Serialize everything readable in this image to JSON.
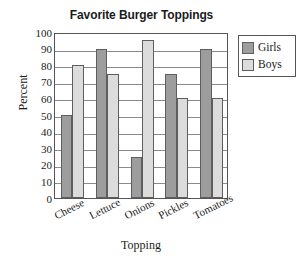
{
  "chart_data": {
    "type": "bar",
    "title": "Favorite Burger Toppings",
    "xlabel": "Topping",
    "ylabel": "Percent",
    "categories": [
      "Cheese",
      "Lettuce",
      "Onions",
      "Pickles",
      "Tomatoes"
    ],
    "series": [
      {
        "name": "Girls",
        "color": "#9d9d9d",
        "values": [
          50,
          90,
          25,
          75,
          90
        ]
      },
      {
        "name": "Boys",
        "color": "#dcdcdc",
        "values": [
          80,
          75,
          95,
          60,
          60
        ]
      }
    ],
    "ylim": [
      0,
      100
    ],
    "ytick_step": 10,
    "yticks": [
      100,
      90,
      80,
      70,
      60,
      50,
      40,
      30,
      20,
      10,
      0
    ],
    "grid": true,
    "grid_axis": "y",
    "legend_position": "right-top"
  },
  "legend": {
    "items": [
      {
        "label": "Girls",
        "swatch": "girls-swatch"
      },
      {
        "label": "Boys",
        "swatch": "boys-swatch"
      }
    ]
  }
}
